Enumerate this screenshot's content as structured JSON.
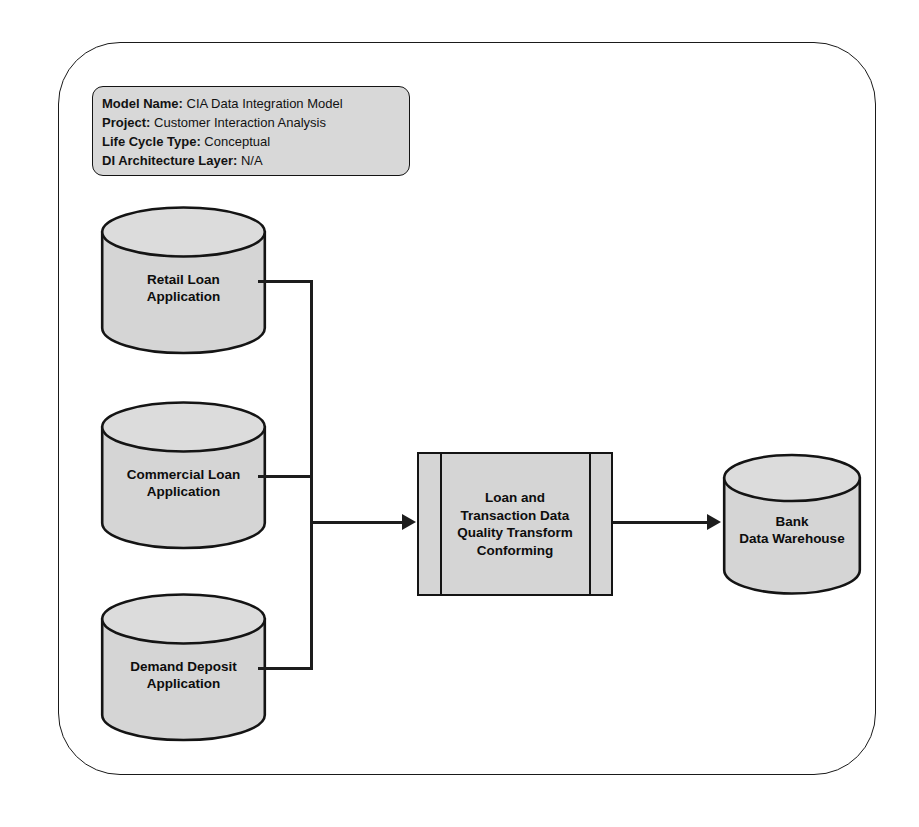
{
  "diagram": {
    "title": "CIA Data Integration Model",
    "metadata": [
      {
        "label": "Model Name:",
        "value": "CIA Data Integration Model"
      },
      {
        "label": "Project:",
        "value": "Customer Interaction Analysis"
      },
      {
        "label": "Life Cycle Type:",
        "value": "Conceptual"
      },
      {
        "label": "DI Architecture Layer:",
        "value": "N/A"
      }
    ],
    "sources": [
      {
        "name": "retail-loan-application",
        "line1": "Retail Loan",
        "line2": "Application"
      },
      {
        "name": "commercial-loan-application",
        "line1": "Commercial Loan",
        "line2": "Application"
      },
      {
        "name": "demand-deposit-application",
        "line1": "Demand Deposit",
        "line2": "Application"
      }
    ],
    "transform": {
      "line1": "Loan and",
      "line2": "Transaction Data",
      "line3": "Quality Transform",
      "line4": "Conforming"
    },
    "target": {
      "name": "bank-data-warehouse",
      "line1": "Bank",
      "line2": "Data Warehouse"
    },
    "colors": {
      "shape_fill": "#d5d5d5",
      "meta_fill": "#d8d8d8",
      "outline": "#141414",
      "connector": "#1d1d1d",
      "background": "#ffffff"
    }
  }
}
